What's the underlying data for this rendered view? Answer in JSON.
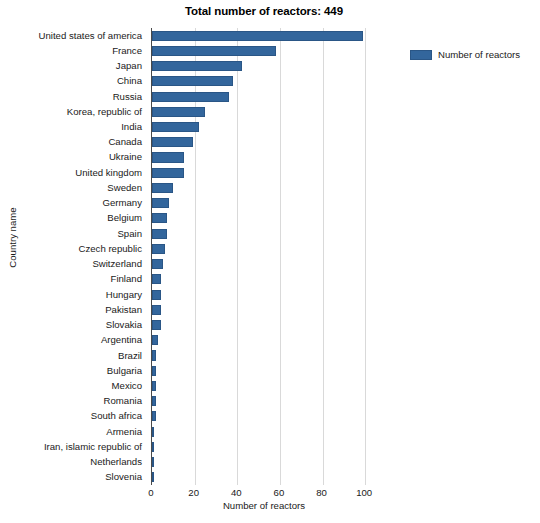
{
  "chart_data": {
    "type": "bar",
    "orientation": "horizontal",
    "title": "Total number of reactors: 449",
    "xlabel": "Number of reactors",
    "ylabel": "Country name",
    "xlim": [
      0,
      106
    ],
    "xticks": [
      0,
      20,
      40,
      60,
      80,
      100
    ],
    "xtick_labels": [
      "0",
      "20",
      "40",
      "60",
      "80",
      "100"
    ],
    "grid": "vertical",
    "legend_position": "right",
    "series": [
      {
        "name": "Number of reactors",
        "color": "#33669c",
        "values": [
          99,
          58,
          42,
          38,
          36,
          25,
          22,
          19,
          15,
          15,
          10,
          8,
          7,
          7,
          6,
          5,
          4,
          4,
          4,
          4,
          3,
          2,
          2,
          2,
          2,
          2,
          1,
          1,
          1,
          1
        ]
      }
    ],
    "categories": [
      "United states of america",
      "France",
      "Japan",
      "China",
      "Russia",
      "Korea, republic of",
      "India",
      "Canada",
      "Ukraine",
      "United kingdom",
      "Sweden",
      "Germany",
      "Belgium",
      "Spain",
      "Czech republic",
      "Switzerland",
      "Finland",
      "Hungary",
      "Pakistan",
      "Slovakia",
      "Argentina",
      "Brazil",
      "Bulgaria",
      "Mexico",
      "Romania",
      "South africa",
      "Armenia",
      "Iran, islamic republic of",
      "Netherlands",
      "Slovenia"
    ]
  },
  "legend": {
    "entries": [
      {
        "label": "Number of reactors",
        "color": "#33669c"
      }
    ]
  },
  "colors": {
    "bar": "#33669c",
    "bar_edge": "#2a5686",
    "grid": "#d9d9d9",
    "axis": "#4a4a4a",
    "background": "#ffffff",
    "text": "#1a1a1a"
  }
}
